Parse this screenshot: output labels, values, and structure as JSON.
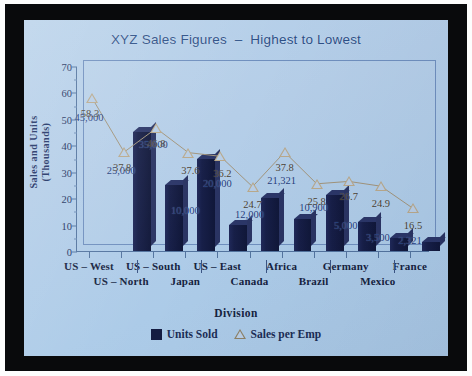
{
  "slide": {
    "background_color": "#b3cde8",
    "frame_color": "#090a0c"
  },
  "chart_data": {
    "type": "bar",
    "title": "XYZ Sales Figures  –  Highest to Lowest",
    "xlabel": "Division",
    "ylabel": "Sales and Units\n(Thousands)",
    "ylabel_line1": "Sales and Units",
    "ylabel_line2": "(Thousands)",
    "ylim": [
      0,
      70
    ],
    "yticks": [
      0,
      10,
      20,
      30,
      40,
      50,
      60,
      70
    ],
    "ytick_labels": [
      "0",
      "10",
      "20",
      "30",
      "40",
      "50",
      "60",
      "70"
    ],
    "grid": false,
    "legend_position": "bottom",
    "categories": [
      "US – West",
      "US – North",
      "US – South",
      "Japan",
      "US – East",
      "Canada",
      "Africa",
      "Brazil",
      "Germany",
      "Mexico",
      "France"
    ],
    "series": [
      {
        "name": "Units Sold",
        "type": "bar",
        "color": "#161f46",
        "values": [
          45,
          25,
          35,
          10,
          20,
          12,
          21.321,
          10.9,
          5,
          3.5,
          2.321
        ],
        "data_labels": [
          "45,000",
          "25,000",
          "35,000",
          "10,000",
          "20,000",
          "12,000",
          "21,321",
          "10,900",
          "5,000",
          "3,500",
          "2,321"
        ]
      },
      {
        "name": "Sales per Emp",
        "type": "line",
        "marker": "triangle-open",
        "color": "#b9a98c",
        "values": [
          58.3,
          37.8,
          46.8,
          37.6,
          36.2,
          24.7,
          37.8,
          25.8,
          26.7,
          24.9,
          16.5
        ],
        "data_labels": [
          "58.3",
          "37.8",
          "46.8",
          "37.6",
          "36.2",
          "24.7",
          "37.8",
          "25.8",
          "26.7",
          "24.9",
          "16.5"
        ]
      }
    ]
  },
  "legend": {
    "items": [
      {
        "label": "Units Sold",
        "marker": "filled-square",
        "color": "#141c42"
      },
      {
        "label": "Sales per Emp",
        "marker": "open-triangle",
        "color": "#8d8166"
      }
    ]
  }
}
